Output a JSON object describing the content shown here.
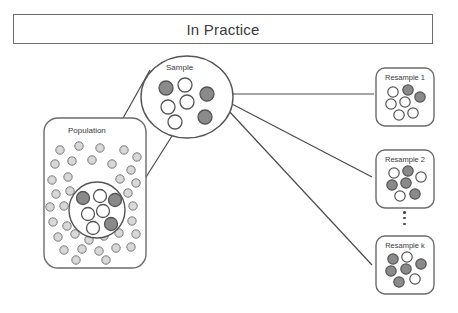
{
  "title": {
    "text": "In Practice"
  },
  "colors": {
    "stroke": "#555555",
    "box_stroke": "#6b6b6b",
    "dot_fill_gray": "#8a8a8a",
    "dot_fill_white": "#ffffff",
    "pop_dot_fill": "#d8d8d8",
    "pop_dot_stroke": "#7a7a7a",
    "line": "#4a4a4a",
    "background": "#ffffff",
    "text": "#3a3a3a"
  },
  "population": {
    "label": "Population",
    "box": {
      "x": 44,
      "y": 118,
      "w": 102,
      "h": 150,
      "r": 14
    },
    "inner_circle": {
      "cx": 97,
      "cy": 210,
      "r": 28
    },
    "inner_dots": [
      {
        "cx": 83,
        "cy": 198,
        "r": 6.5,
        "fill": "gray"
      },
      {
        "cx": 100,
        "cy": 196,
        "r": 6.5,
        "fill": "white"
      },
      {
        "cx": 115,
        "cy": 200,
        "r": 6.5,
        "fill": "gray"
      },
      {
        "cx": 88,
        "cy": 214,
        "r": 6.5,
        "fill": "white"
      },
      {
        "cx": 103,
        "cy": 211,
        "r": 6.5,
        "fill": "white"
      },
      {
        "cx": 93,
        "cy": 228,
        "r": 6.5,
        "fill": "white"
      },
      {
        "cx": 111,
        "cy": 224,
        "r": 6.5,
        "fill": "gray"
      }
    ],
    "scatter_dots": [
      {
        "cx": 60,
        "cy": 150,
        "r": 4.2
      },
      {
        "cx": 79,
        "cy": 146,
        "r": 4.2
      },
      {
        "cx": 100,
        "cy": 148,
        "r": 4.2
      },
      {
        "cx": 124,
        "cy": 150,
        "r": 4.2
      },
      {
        "cx": 137,
        "cy": 157,
        "r": 4.2
      },
      {
        "cx": 55,
        "cy": 164,
        "r": 4.2
      },
      {
        "cx": 72,
        "cy": 161,
        "r": 4.2
      },
      {
        "cx": 92,
        "cy": 160,
        "r": 4.2
      },
      {
        "cx": 112,
        "cy": 164,
        "r": 4.2
      },
      {
        "cx": 131,
        "cy": 170,
        "r": 4.2
      },
      {
        "cx": 52,
        "cy": 180,
        "r": 4.2
      },
      {
        "cx": 68,
        "cy": 177,
        "r": 4.2
      },
      {
        "cx": 120,
        "cy": 179,
        "r": 4.2
      },
      {
        "cx": 136,
        "cy": 183,
        "r": 4.2
      },
      {
        "cx": 56,
        "cy": 194,
        "r": 4.2
      },
      {
        "cx": 70,
        "cy": 191,
        "r": 4.2
      },
      {
        "cx": 128,
        "cy": 193,
        "r": 4.2
      },
      {
        "cx": 50,
        "cy": 207,
        "r": 4.2
      },
      {
        "cx": 64,
        "cy": 206,
        "r": 4.2
      },
      {
        "cx": 133,
        "cy": 206,
        "r": 4.2
      },
      {
        "cx": 53,
        "cy": 222,
        "r": 4.2
      },
      {
        "cx": 67,
        "cy": 226,
        "r": 4.2
      },
      {
        "cx": 132,
        "cy": 221,
        "r": 4.2
      },
      {
        "cx": 58,
        "cy": 237,
        "r": 4.2
      },
      {
        "cx": 75,
        "cy": 234,
        "r": 4.2
      },
      {
        "cx": 89,
        "cy": 240,
        "r": 4.2
      },
      {
        "cx": 104,
        "cy": 236,
        "r": 4.2
      },
      {
        "cx": 119,
        "cy": 233,
        "r": 4.2
      },
      {
        "cx": 136,
        "cy": 234,
        "r": 4.2
      },
      {
        "cx": 64,
        "cy": 250,
        "r": 4.2
      },
      {
        "cx": 82,
        "cy": 249,
        "r": 4.2
      },
      {
        "cx": 99,
        "cy": 251,
        "r": 4.2
      },
      {
        "cx": 116,
        "cy": 248,
        "r": 4.2
      },
      {
        "cx": 131,
        "cy": 247,
        "r": 4.2
      },
      {
        "cx": 76,
        "cy": 260,
        "r": 4.2
      },
      {
        "cx": 106,
        "cy": 260,
        "r": 4.2
      }
    ]
  },
  "sample": {
    "label": "Sample",
    "ellipse": {
      "cx": 187,
      "cy": 97,
      "rx": 46,
      "ry": 41
    },
    "dots": [
      {
        "cx": 166,
        "cy": 88,
        "r": 7,
        "fill": "gray"
      },
      {
        "cx": 185,
        "cy": 85,
        "r": 7,
        "fill": "white"
      },
      {
        "cx": 207,
        "cy": 94,
        "r": 7,
        "fill": "gray"
      },
      {
        "cx": 168,
        "cy": 107,
        "r": 7,
        "fill": "white"
      },
      {
        "cx": 187,
        "cy": 102,
        "r": 7,
        "fill": "white"
      },
      {
        "cx": 205,
        "cy": 117,
        "r": 7,
        "fill": "gray"
      },
      {
        "cx": 175,
        "cy": 122,
        "r": 7,
        "fill": "white"
      }
    ]
  },
  "magnify_lines": [
    {
      "x1": 80,
      "y1": 195,
      "x2": 150,
      "y2": 70
    },
    {
      "x1": 122,
      "y1": 215,
      "x2": 172,
      "y2": 136
    }
  ],
  "fan_lines": [
    {
      "x1": 231,
      "y1": 94,
      "x2": 374,
      "y2": 94
    },
    {
      "x1": 230,
      "y1": 103,
      "x2": 372,
      "y2": 177
    },
    {
      "x1": 228,
      "y1": 110,
      "x2": 372,
      "y2": 265
    }
  ],
  "resamples": [
    {
      "label": "Resample 1",
      "box": {
        "x": 376,
        "y": 68,
        "w": 58,
        "h": 58,
        "r": 9
      },
      "label_pos": {
        "x": 381,
        "y": 73
      },
      "dots": [
        {
          "cx": 393,
          "cy": 92,
          "r": 5.2,
          "fill": "white"
        },
        {
          "cx": 408,
          "cy": 90,
          "r": 5.2,
          "fill": "gray"
        },
        {
          "cx": 420,
          "cy": 97,
          "r": 5.2,
          "fill": "gray"
        },
        {
          "cx": 391,
          "cy": 104,
          "r": 5.2,
          "fill": "white"
        },
        {
          "cx": 405,
          "cy": 102,
          "r": 5.2,
          "fill": "white"
        },
        {
          "cx": 399,
          "cy": 115,
          "r": 5.2,
          "fill": "white"
        },
        {
          "cx": 413,
          "cy": 113,
          "r": 5.2,
          "fill": "white"
        }
      ]
    },
    {
      "label": "Resample 2",
      "box": {
        "x": 376,
        "y": 150,
        "w": 58,
        "h": 58,
        "r": 9
      },
      "label_pos": {
        "x": 381,
        "y": 155
      },
      "dots": [
        {
          "cx": 394,
          "cy": 173,
          "r": 5.2,
          "fill": "white"
        },
        {
          "cx": 408,
          "cy": 171,
          "r": 5.2,
          "fill": "gray"
        },
        {
          "cx": 421,
          "cy": 177,
          "r": 5.2,
          "fill": "white"
        },
        {
          "cx": 392,
          "cy": 185,
          "r": 5.2,
          "fill": "gray"
        },
        {
          "cx": 406,
          "cy": 183,
          "r": 5.2,
          "fill": "gray"
        },
        {
          "cx": 400,
          "cy": 196,
          "r": 5.2,
          "fill": "white"
        },
        {
          "cx": 415,
          "cy": 194,
          "r": 5.2,
          "fill": "gray"
        }
      ]
    },
    {
      "label": "Resample k",
      "box": {
        "x": 376,
        "y": 236,
        "w": 58,
        "h": 58,
        "r": 9
      },
      "label_pos": {
        "x": 381,
        "y": 241
      },
      "dots": [
        {
          "cx": 393,
          "cy": 259,
          "r": 5.2,
          "fill": "gray"
        },
        {
          "cx": 407,
          "cy": 257,
          "r": 5.2,
          "fill": "white"
        },
        {
          "cx": 421,
          "cy": 264,
          "r": 5.2,
          "fill": "gray"
        },
        {
          "cx": 391,
          "cy": 271,
          "r": 5.2,
          "fill": "gray"
        },
        {
          "cx": 406,
          "cy": 269,
          "r": 5.2,
          "fill": "gray"
        },
        {
          "cx": 399,
          "cy": 282,
          "r": 5.2,
          "fill": "gray"
        },
        {
          "cx": 415,
          "cy": 279,
          "r": 5.2,
          "fill": "white"
        }
      ]
    }
  ],
  "ellipsis": {
    "dots": 3
  }
}
